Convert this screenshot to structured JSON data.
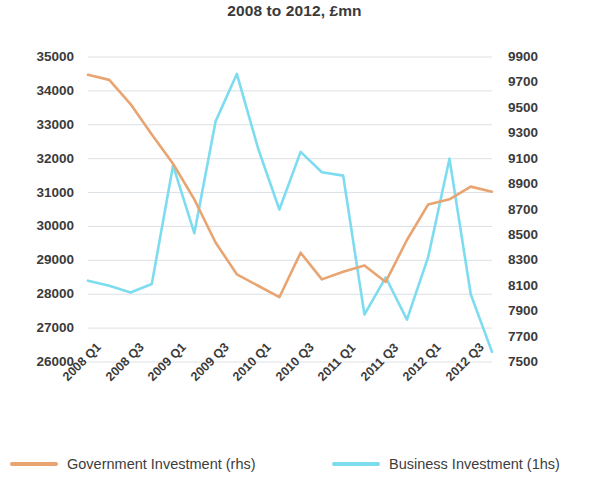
{
  "chart_data": {
    "type": "line",
    "title": "2008 to 2012, £mn",
    "xlabel": "",
    "ylabel": "",
    "grid": true,
    "legend_position": "bottom",
    "x": [
      "2008 Q1",
      "2008 Q2",
      "2008 Q3",
      "2008 Q4",
      "2009 Q1",
      "2009 Q2",
      "2009 Q3",
      "2009 Q4",
      "2010 Q1",
      "2010 Q2",
      "2010 Q3",
      "2010 Q4",
      "2011 Q1",
      "2011 Q2",
      "2011 Q3",
      "2011 Q4",
      "2012 Q1",
      "2012 Q2",
      "2012 Q3",
      "2012 Q4"
    ],
    "xtick_labels": [
      "2008 Q1",
      "2008 Q3",
      "2009 Q1",
      "2009 Q3",
      "2010 Q1",
      "2010 Q3",
      "2011 Q1",
      "2011 Q3",
      "2012 Q1",
      "2012 Q3"
    ],
    "left_axis": {
      "name": "Business Investment (1hs)",
      "ticks": [
        26000,
        27000,
        28000,
        29000,
        30000,
        31000,
        32000,
        33000,
        34000,
        35000
      ],
      "ylim": [
        26000,
        35000
      ]
    },
    "right_axis": {
      "name": "Government Investment (rhs)",
      "ticks": [
        7500,
        7700,
        7900,
        8100,
        8300,
        8500,
        8700,
        8900,
        9100,
        9300,
        9500,
        9700,
        9900
      ],
      "ylim": [
        7500,
        9900
      ]
    },
    "series": [
      {
        "name": "Business Investment (1hs)",
        "axis": "left",
        "color": "#7DDCEF",
        "values": [
          28400,
          28250,
          28050,
          28300,
          31800,
          29800,
          33100,
          34500,
          32300,
          30500,
          32200,
          31600,
          31500,
          27400,
          28500,
          27250,
          29100,
          32000,
          28000,
          26300
        ]
      },
      {
        "name": "Government Investment (rhs)",
        "axis": "right",
        "color": "#E8A471",
        "values": [
          9760,
          9720,
          9530,
          9290,
          9060,
          8780,
          8440,
          8190,
          8100,
          8010,
          8360,
          8150,
          8210,
          8260,
          8130,
          8460,
          8740,
          8780,
          8880,
          8840
        ]
      }
    ]
  },
  "legend": {
    "government": {
      "label": "Government Investment (rhs)",
      "color": "#E8A471"
    },
    "business": {
      "label": "Business Investment (1hs)",
      "color": "#7DDCEF"
    }
  }
}
